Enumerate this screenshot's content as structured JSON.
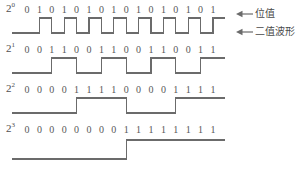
{
  "figure": {
    "line_color": "#6b6b6b",
    "text_color": "#585858",
    "background": "#ffffff",
    "bit_count": 16,
    "first_digit_x": 27,
    "digit_pitch": 12.4
  },
  "annotations": [
    {
      "name": "bit-value-annotation",
      "label": "位值",
      "arrow": "left-arrow",
      "x": 236,
      "y": 9
    },
    {
      "name": "binary-waveform-annotation",
      "label": "二值波形",
      "arrow": "left-arrow",
      "x": 236,
      "y": 27
    }
  ],
  "rows": [
    {
      "name": "row-2-pow-0",
      "label_base": "2",
      "label_exp": "0",
      "digits": [
        "0",
        "1",
        "0",
        "1",
        "0",
        "1",
        "0",
        "1",
        "0",
        "1",
        "0",
        "1",
        "0",
        "1",
        "0",
        "1"
      ],
      "levels": [
        0,
        1,
        0,
        1,
        0,
        1,
        0,
        1,
        0,
        1,
        0,
        1,
        0,
        1,
        0,
        1
      ],
      "top": 3,
      "digits_top": 3,
      "wave_top": 17,
      "wave_height": 16
    },
    {
      "name": "row-2-pow-1",
      "label_base": "2",
      "label_exp": "1",
      "digits": [
        "0",
        "0",
        "1",
        "1",
        "0",
        "0",
        "1",
        "1",
        "0",
        "0",
        "1",
        "1",
        "0",
        "0",
        "1",
        "1"
      ],
      "levels": [
        0,
        0,
        1,
        1,
        0,
        0,
        1,
        1,
        0,
        0,
        1,
        1,
        0,
        0,
        1,
        1
      ],
      "top": 43,
      "digits_top": 43,
      "wave_top": 57,
      "wave_height": 16
    },
    {
      "name": "row-2-pow-2",
      "label_base": "2",
      "label_exp": "2",
      "digits": [
        "0",
        "0",
        "0",
        "0",
        "1",
        "1",
        "1",
        "1",
        "0",
        "0",
        "0",
        "0",
        "1",
        "1",
        "1",
        "1"
      ],
      "levels": [
        0,
        0,
        0,
        0,
        1,
        1,
        1,
        1,
        0,
        0,
        0,
        0,
        1,
        1,
        1,
        1
      ],
      "top": 83,
      "digits_top": 83,
      "wave_top": 97,
      "wave_height": 16
    },
    {
      "name": "row-2-pow-3",
      "label_base": "2",
      "label_exp": "3",
      "digits": [
        "0",
        "0",
        "0",
        "0",
        "0",
        "0",
        "0",
        "0",
        "1",
        "1",
        "1",
        "1",
        "1",
        "1",
        "1",
        "1"
      ],
      "levels": [
        0,
        0,
        0,
        0,
        0,
        0,
        0,
        0,
        1,
        1,
        1,
        1,
        1,
        1,
        1,
        1
      ],
      "top": 123,
      "digits_top": 123,
      "wave_top": 139,
      "wave_height": 20
    }
  ]
}
